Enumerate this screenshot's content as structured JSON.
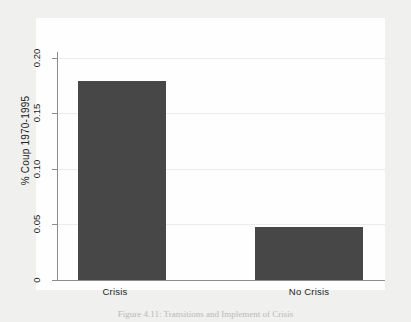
{
  "chart_data": {
    "type": "bar",
    "title": "",
    "subtitle": "",
    "xlabel": "",
    "ylabel": "% Coup 1970-1995",
    "categories": [
      "Crisis",
      "No Crisis"
    ],
    "values": [
      0.188,
      0.05
    ],
    "ylim": [
      0,
      0.213
    ],
    "yticks": [
      0,
      0.05,
      0.1,
      0.15,
      0.2
    ],
    "ytick_labels": [
      "0",
      "0.05",
      "0.10",
      "0.15",
      "0.20"
    ],
    "grid": true,
    "legend": null,
    "bar_color": "#474747",
    "plot_background": "#fefefe",
    "page_background": "#f0f0ef",
    "gridline_color": "#ececec",
    "axis_color": "#8d8d8d"
  },
  "caption": {
    "text": "Figure 4.11: Transitions and Implement of Crisis"
  }
}
